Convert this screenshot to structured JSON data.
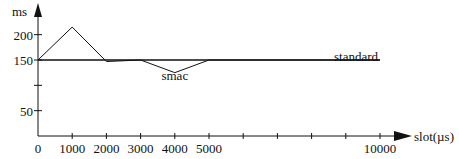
{
  "chart_data": {
    "type": "line",
    "title": "",
    "xlabel": "slot(µs)",
    "ylabel": "ms",
    "xlim": [
      0,
      10000
    ],
    "ylim": [
      0,
      200
    ],
    "x_ticks": [
      0,
      1000,
      2000,
      3000,
      4000,
      5000,
      6000,
      7000,
      8000,
      9000,
      10000
    ],
    "x_tick_labels": [
      "0",
      "1000",
      "2000",
      "3000",
      "4000",
      "5000",
      "",
      "",
      "",
      "",
      "10000"
    ],
    "y_ticks": [
      50,
      100,
      150,
      200
    ],
    "y_tick_labels": [
      "50",
      "",
      "150",
      "200"
    ],
    "grid": false,
    "series": [
      {
        "name": "smac",
        "x": [
          0,
          1000,
          2000,
          3000,
          4000,
          5000,
          10000
        ],
        "y": [
          150,
          215,
          147,
          150,
          125,
          150,
          150
        ]
      },
      {
        "name": "standard",
        "x": [
          0,
          10000
        ],
        "y": [
          150,
          150
        ]
      }
    ],
    "annotations": [
      {
        "text": "smac",
        "x": 4000,
        "y": 118
      },
      {
        "text": "standard",
        "x": 9300,
        "y": 156
      }
    ]
  }
}
